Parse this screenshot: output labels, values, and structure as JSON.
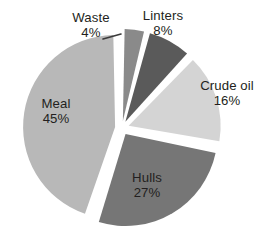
{
  "chart_data": {
    "type": "pie",
    "title": "",
    "subtitle": "",
    "xlabel": "",
    "ylabel": "",
    "legend": "none",
    "grid": false,
    "label_format": "name + percent",
    "exploded": true,
    "start_angle_deg": 0,
    "direction": "clockwise",
    "categories": [
      "Waste",
      "Linters",
      "Crude oil",
      "Hulls",
      "Meal"
    ],
    "values": [
      4,
      8,
      16,
      27,
      45
    ],
    "value_unit": "%",
    "slices": [
      {
        "name": "Waste",
        "value": 4,
        "percent_label": "4%",
        "color": "#8a8a8a",
        "label_position": "outside",
        "has_leader_line": true
      },
      {
        "name": "Linters",
        "value": 8,
        "percent_label": "8%",
        "color": "#5a5a5a",
        "label_position": "outside",
        "has_leader_line": false
      },
      {
        "name": "Crude oil",
        "value": 16,
        "percent_label": "16%",
        "color": "#d4d4d4",
        "label_position": "outside",
        "has_leader_line": false
      },
      {
        "name": "Hulls",
        "value": 27,
        "percent_label": "27%",
        "color": "#767676",
        "label_position": "inside",
        "has_leader_line": false
      },
      {
        "name": "Meal",
        "value": 45,
        "percent_label": "45%",
        "color": "#b8b8b8",
        "label_position": "inside",
        "has_leader_line": false
      }
    ],
    "total": 100,
    "background_color": "#ffffff",
    "text_color": "#231f20"
  }
}
